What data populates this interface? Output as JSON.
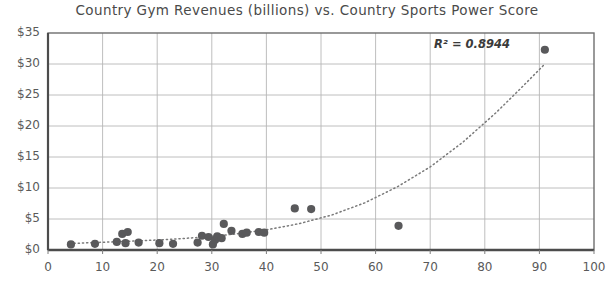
{
  "chart_data": {
    "type": "scatter",
    "title": "Country Gym Revenues (billions) vs. Country Sports Power Score",
    "xlabel": "",
    "ylabel": "",
    "xlim": [
      0,
      100
    ],
    "ylim": [
      0,
      35
    ],
    "grid": true,
    "legend": false,
    "x_ticks": [
      0,
      10,
      20,
      30,
      40,
      50,
      60,
      70,
      80,
      90,
      100
    ],
    "x_tick_labels": [
      "0",
      "10",
      "20",
      "30",
      "40",
      "50",
      "60",
      "70",
      "80",
      "90",
      "100"
    ],
    "y_ticks": [
      0,
      5,
      10,
      15,
      20,
      25,
      30,
      35
    ],
    "y_tick_labels": [
      "$0",
      "$5",
      "$10",
      "$15",
      "$20",
      "$25",
      "$30",
      "$35"
    ],
    "annotation": "R² = 0.8944",
    "marker_color": "#59595b",
    "trendline_color": "#7a7a7a",
    "trendline_style": "dotted",
    "trendline_type": "exponential",
    "points": [
      {
        "x": 4.2,
        "y": 0.9
      },
      {
        "x": 8.6,
        "y": 1.0
      },
      {
        "x": 12.6,
        "y": 1.3
      },
      {
        "x": 13.6,
        "y": 2.6
      },
      {
        "x": 14.6,
        "y": 2.9
      },
      {
        "x": 14.2,
        "y": 1.1
      },
      {
        "x": 16.6,
        "y": 1.2
      },
      {
        "x": 20.4,
        "y": 1.1
      },
      {
        "x": 22.9,
        "y": 1.0
      },
      {
        "x": 27.4,
        "y": 1.2
      },
      {
        "x": 28.2,
        "y": 2.3
      },
      {
        "x": 29.4,
        "y": 2.1
      },
      {
        "x": 30.2,
        "y": 0.9
      },
      {
        "x": 30.6,
        "y": 1.6
      },
      {
        "x": 31.0,
        "y": 2.2
      },
      {
        "x": 31.8,
        "y": 1.9
      },
      {
        "x": 32.2,
        "y": 4.2
      },
      {
        "x": 33.6,
        "y": 3.1
      },
      {
        "x": 35.6,
        "y": 2.6
      },
      {
        "x": 36.4,
        "y": 2.8
      },
      {
        "x": 38.6,
        "y": 2.9
      },
      {
        "x": 39.6,
        "y": 2.8
      },
      {
        "x": 45.2,
        "y": 6.7
      },
      {
        "x": 48.2,
        "y": 6.6
      },
      {
        "x": 64.2,
        "y": 3.9
      },
      {
        "x": 91.0,
        "y": 32.3
      }
    ],
    "trendline": [
      {
        "x": 4.0,
        "y": 1.05
      },
      {
        "x": 10.0,
        "y": 1.25
      },
      {
        "x": 16.0,
        "y": 1.45
      },
      {
        "x": 22.0,
        "y": 1.7
      },
      {
        "x": 28.0,
        "y": 2.05
      },
      {
        "x": 34.0,
        "y": 2.55
      },
      {
        "x": 40.0,
        "y": 3.25
      },
      {
        "x": 46.0,
        "y": 4.25
      },
      {
        "x": 52.0,
        "y": 5.65
      },
      {
        "x": 58.0,
        "y": 7.6
      },
      {
        "x": 64.0,
        "y": 10.2
      },
      {
        "x": 70.0,
        "y": 13.4
      },
      {
        "x": 76.0,
        "y": 17.4
      },
      {
        "x": 82.0,
        "y": 22.1
      },
      {
        "x": 86.5,
        "y": 26.0
      },
      {
        "x": 91.0,
        "y": 30.0
      }
    ]
  }
}
